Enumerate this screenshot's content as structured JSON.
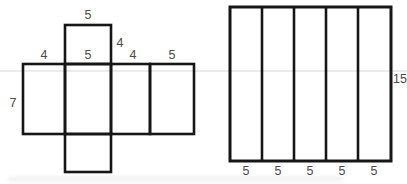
{
  "figure_type": "geometry-diagram",
  "net_figure": {
    "type": "net-of-rectangular-prism",
    "labels": {
      "flap_top": "5",
      "flap_right_side": "4",
      "face1_top": "4",
      "face2_top": "5",
      "face3_top": "4",
      "face4_top": "5",
      "left_side": "7"
    }
  },
  "strip_figure": {
    "type": "rectangle-divided-into-five-vertical-strips",
    "bottom_labels": [
      "5",
      "5",
      "5",
      "5",
      "5"
    ],
    "right_side_label": "15"
  },
  "colors": {
    "line": "#161616",
    "label_text": "#4a4a4a",
    "faint_rule": "#d8d8d8",
    "background": "#ffffff"
  }
}
